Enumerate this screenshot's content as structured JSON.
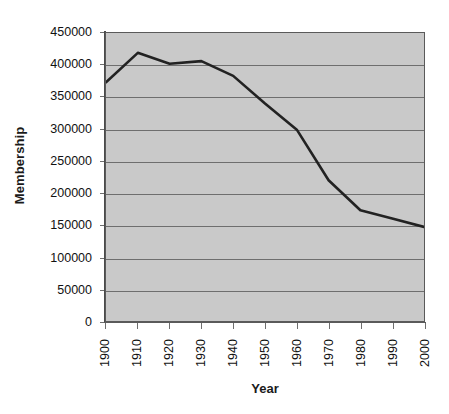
{
  "chart_data": {
    "type": "line",
    "title": "",
    "xlabel": "Year",
    "ylabel": "Membership",
    "x": [
      1900,
      1910,
      1920,
      1930,
      1940,
      1950,
      1960,
      1970,
      1980,
      1990,
      2000
    ],
    "values": [
      373000,
      419000,
      402000,
      406000,
      383000,
      340000,
      299000,
      220000,
      173000,
      160000,
      147000
    ],
    "series": [
      {
        "name": "Membership",
        "values": [
          373000,
          419000,
          402000,
          406000,
          383000,
          340000,
          299000,
          220000,
          173000,
          160000,
          147000
        ]
      }
    ],
    "xlim": [
      1900,
      2000
    ],
    "ylim": [
      0,
      450000
    ],
    "ytick_labels": [
      "450000",
      "400000",
      "350000",
      "300000",
      "250000",
      "200000",
      "150000",
      "100000",
      "50000",
      "0"
    ],
    "ytick_values": [
      450000,
      400000,
      350000,
      300000,
      250000,
      200000,
      150000,
      100000,
      50000,
      0
    ],
    "xtick_labels": [
      "1900",
      "1910",
      "1920",
      "1930",
      "1940",
      "1950",
      "1960",
      "1970",
      "1980",
      "1990",
      "2000"
    ],
    "grid": "horizontal",
    "legend": "none",
    "colors": {
      "plot_background": "#c9c9c9",
      "line": "#222222",
      "gridline": "#6e6e6e",
      "axis": "#4a4a4a",
      "text": "#111111",
      "page_background": "#ffffff"
    }
  }
}
